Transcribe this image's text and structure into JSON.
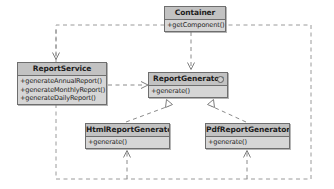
{
  "diagram": {
    "type": "uml-class-diagram",
    "title": "",
    "colors": {
      "class_header_fill": "#c2c2c2",
      "class_body_fill": "#d6d6d6",
      "class_border": "#6e6e6e",
      "edge_line": "#8a8a8a",
      "frame_line": "#9a9a9a",
      "text": "#1d1d1d",
      "canvas": "#ffffff"
    },
    "classes": [
      {
        "id": "container",
        "name": "Container",
        "stereotype": "",
        "is_interface": false,
        "members": [
          "+getComponent()"
        ],
        "x": 164,
        "y": 6,
        "width": 62,
        "height": 26
      },
      {
        "id": "report_service",
        "name": "ReportService",
        "stereotype": "",
        "is_interface": false,
        "members": [
          "+generateAnnualReport()",
          "+generateMonthlyReport()",
          "+generateDailyReport()"
        ],
        "x": 17,
        "y": 62,
        "width": 90,
        "height": 43
      },
      {
        "id": "report_generator",
        "name": "ReportGenerator",
        "stereotype": "",
        "is_interface": true,
        "members": [
          "+generate()"
        ],
        "x": 148,
        "y": 72,
        "width": 80,
        "height": 26
      },
      {
        "id": "html_report_generator",
        "name": "HtmlReportGenerator",
        "stereotype": "",
        "is_interface": false,
        "members": [
          "+generate()"
        ],
        "x": 85,
        "y": 123,
        "width": 85,
        "height": 26
      },
      {
        "id": "pdf_report_generator",
        "name": "PdfReportGenerator",
        "stereotype": "",
        "is_interface": false,
        "members": [
          "+generate()"
        ],
        "x": 205,
        "y": 123,
        "width": 85,
        "height": 26
      }
    ],
    "relationships": [
      {
        "id": "container-to-report-service",
        "from": "container",
        "to": "report_service",
        "kind": "dependency",
        "line": "dashed",
        "arrow": "open"
      },
      {
        "id": "container-to-report-generator",
        "from": "container",
        "to": "report_generator",
        "kind": "dependency",
        "line": "dashed",
        "arrow": "open"
      },
      {
        "id": "report-service-to-report-generator",
        "from": "report_service",
        "to": "report_generator",
        "kind": "dependency",
        "line": "dashed",
        "arrow": "open"
      },
      {
        "id": "html-report-generator-realizes-report-generator",
        "from": "html_report_generator",
        "to": "report_generator",
        "kind": "realization",
        "line": "dashed",
        "arrow": "hollow-triangle"
      },
      {
        "id": "pdf-report-generator-realizes-report-generator",
        "from": "pdf_report_generator",
        "to": "report_generator",
        "kind": "realization",
        "line": "dashed",
        "arrow": "hollow-triangle"
      },
      {
        "id": "container-creates-html-report-generator",
        "from": "container",
        "to": "html_report_generator",
        "kind": "dependency",
        "line": "dashed",
        "arrow": "open",
        "routing": "orthogonal-frame"
      },
      {
        "id": "container-creates-pdf-report-generator",
        "from": "container",
        "to": "pdf_report_generator",
        "kind": "dependency",
        "line": "dashed",
        "arrow": "open",
        "routing": "orthogonal-frame"
      }
    ]
  }
}
